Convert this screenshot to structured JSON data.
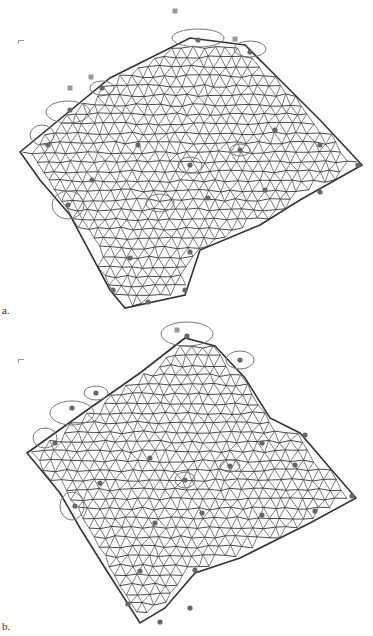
{
  "figure": {
    "panels": [
      {
        "id": "a",
        "label": "a.",
        "description": "Triangulated deformable mesh with landmark ellipses",
        "outline": [
          [
            20,
            152
          ],
          [
            110,
            78
          ],
          [
            190,
            38
          ],
          [
            245,
            45
          ],
          [
            270,
            70
          ],
          [
            320,
            120
          ],
          [
            362,
            165
          ],
          [
            300,
            200
          ],
          [
            260,
            225
          ],
          [
            200,
            250
          ],
          [
            185,
            295
          ],
          [
            125,
            308
          ],
          [
            110,
            290
          ],
          [
            70,
            215
          ],
          [
            40,
            180
          ]
        ],
        "landmarks_outside": [
          [
            175,
            11
          ],
          [
            91,
            77
          ],
          [
            70,
            88
          ],
          [
            235,
            39
          ]
        ],
        "ellipses": [
          {
            "cx": 198,
            "cy": 38,
            "rx": 26,
            "ry": 9
          },
          {
            "cx": 250,
            "cy": 49,
            "rx": 16,
            "ry": 8
          },
          {
            "cx": 102,
            "cy": 88,
            "rx": 12,
            "ry": 7
          },
          {
            "cx": 68,
            "cy": 112,
            "rx": 22,
            "ry": 11
          },
          {
            "cx": 42,
            "cy": 135,
            "rx": 12,
            "ry": 10
          },
          {
            "cx": 68,
            "cy": 205,
            "rx": 16,
            "ry": 14
          },
          {
            "cx": 160,
            "cy": 203,
            "rx": 14,
            "ry": 9
          },
          {
            "cx": 240,
            "cy": 150,
            "rx": 10,
            "ry": 6
          },
          {
            "cx": 190,
            "cy": 165,
            "rx": 12,
            "ry": 8
          }
        ],
        "markers": [
          [
            198,
            40
          ],
          [
            250,
            52
          ],
          [
            102,
            88
          ],
          [
            70,
            110
          ],
          [
            48,
            145
          ],
          [
            92,
            180
          ],
          [
            68,
            205
          ],
          [
            138,
            145
          ],
          [
            190,
            165
          ],
          [
            240,
            150
          ],
          [
            275,
            130
          ],
          [
            320,
            145
          ],
          [
            358,
            165
          ],
          [
            265,
            190
          ],
          [
            208,
            198
          ],
          [
            320,
            192
          ],
          [
            130,
            258
          ],
          [
            190,
            252
          ],
          [
            113,
            290
          ],
          [
            185,
            290
          ],
          [
            148,
            302
          ]
        ]
      },
      {
        "id": "b",
        "label": "b.",
        "description": "Triangulated mesh after registration with landmark ellipses",
        "outline": [
          [
            27,
            135
          ],
          [
            90,
            90
          ],
          [
            140,
            55
          ],
          [
            185,
            20
          ],
          [
            215,
            28
          ],
          [
            245,
            60
          ],
          [
            270,
            100
          ],
          [
            300,
            115
          ],
          [
            330,
            150
          ],
          [
            356,
            180
          ],
          [
            310,
            205
          ],
          [
            240,
            240
          ],
          [
            195,
            255
          ],
          [
            165,
            290
          ],
          [
            140,
            305
          ],
          [
            105,
            250
          ],
          [
            80,
            210
          ],
          [
            60,
            175
          ]
        ],
        "landmarks_outside": [
          [
            177,
            12
          ]
        ],
        "ellipses": [
          {
            "cx": 187,
            "cy": 16,
            "rx": 26,
            "ry": 12
          },
          {
            "cx": 240,
            "cy": 42,
            "rx": 14,
            "ry": 9
          },
          {
            "cx": 96,
            "cy": 75,
            "rx": 12,
            "ry": 7
          },
          {
            "cx": 72,
            "cy": 95,
            "rx": 22,
            "ry": 12
          },
          {
            "cx": 45,
            "cy": 120,
            "rx": 12,
            "ry": 10
          },
          {
            "cx": 72,
            "cy": 188,
            "rx": 12,
            "ry": 14
          },
          {
            "cx": 185,
            "cy": 162,
            "rx": 10,
            "ry": 8
          },
          {
            "cx": 230,
            "cy": 148,
            "rx": 10,
            "ry": 6
          }
        ],
        "markers": [
          [
            187,
            18
          ],
          [
            240,
            42
          ],
          [
            96,
            75
          ],
          [
            72,
            90
          ],
          [
            55,
            125
          ],
          [
            100,
            165
          ],
          [
            75,
            188
          ],
          [
            150,
            140
          ],
          [
            185,
            162
          ],
          [
            230,
            148
          ],
          [
            262,
            125
          ],
          [
            305,
            117
          ],
          [
            295,
            147
          ],
          [
            352,
            178
          ],
          [
            315,
            193
          ],
          [
            262,
            197
          ],
          [
            202,
            195
          ],
          [
            155,
            205
          ],
          [
            140,
            253
          ],
          [
            195,
            252
          ],
          [
            128,
            286
          ],
          [
            190,
            290
          ],
          [
            160,
            304
          ]
        ]
      }
    ]
  }
}
